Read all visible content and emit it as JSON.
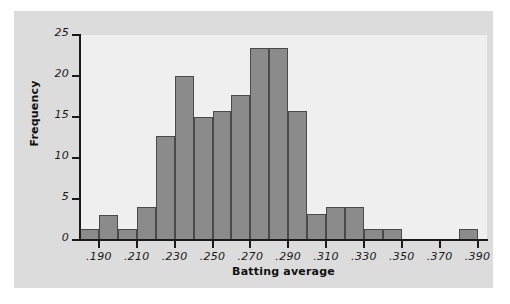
{
  "chart_data": {
    "type": "bar",
    "title": "",
    "subtitle": "",
    "xlabel": "Batting average",
    "ylabel": "Frequency",
    "xlim": [
      0.18,
      0.395
    ],
    "ylim": [
      0,
      25
    ],
    "grid": false,
    "legend": null,
    "bin_width": 0.01,
    "x_tick_labels": [
      ".190",
      ".210",
      ".230",
      ".250",
      ".270",
      ".290",
      ".310",
      ".330",
      ".350",
      ".370",
      ".390"
    ],
    "x_tick_values": [
      0.19,
      0.21,
      0.23,
      0.25,
      0.27,
      0.29,
      0.31,
      0.33,
      0.35,
      0.37,
      0.39
    ],
    "y_tick_labels": [
      "0",
      "5",
      "10",
      "15",
      "20",
      "25"
    ],
    "y_tick_values": [
      0,
      5,
      10,
      15,
      20,
      25
    ],
    "categories": [
      "0.180-0.190",
      "0.190-0.200",
      "0.200-0.210",
      "0.210-0.220",
      "0.220-0.230",
      "0.230-0.240",
      "0.240-0.250",
      "0.250-0.260",
      "0.260-0.270",
      "0.270-0.280",
      "0.280-0.290",
      "0.290-0.300",
      "0.300-0.310",
      "0.310-0.320",
      "0.320-0.330",
      "0.330-0.340",
      "0.340-0.350",
      "0.350-0.360",
      "0.360-0.370",
      "0.370-0.380",
      "0.380-0.390"
    ],
    "bin_starts": [
      0.18,
      0.19,
      0.2,
      0.21,
      0.22,
      0.23,
      0.24,
      0.25,
      0.26,
      0.27,
      0.28,
      0.29,
      0.3,
      0.31,
      0.32,
      0.33,
      0.34,
      0.35,
      0.36,
      0.37,
      0.38
    ],
    "values": [
      1.3,
      3,
      1.3,
      4,
      12.7,
      20,
      15,
      15.7,
      17.7,
      23.4,
      23.4,
      15.7,
      3.2,
      4,
      4,
      1.3,
      1.3,
      0,
      0,
      0,
      1.3
    ]
  },
  "colors": {
    "bar_fill": "#8b8b8b",
    "bar_edge": "#4a4a4a",
    "plot_background": "#efeff0",
    "figure_background": "#dcdcdc",
    "page_background": "#ffffff",
    "axis": "#1a1a1a",
    "text": "#111111"
  }
}
